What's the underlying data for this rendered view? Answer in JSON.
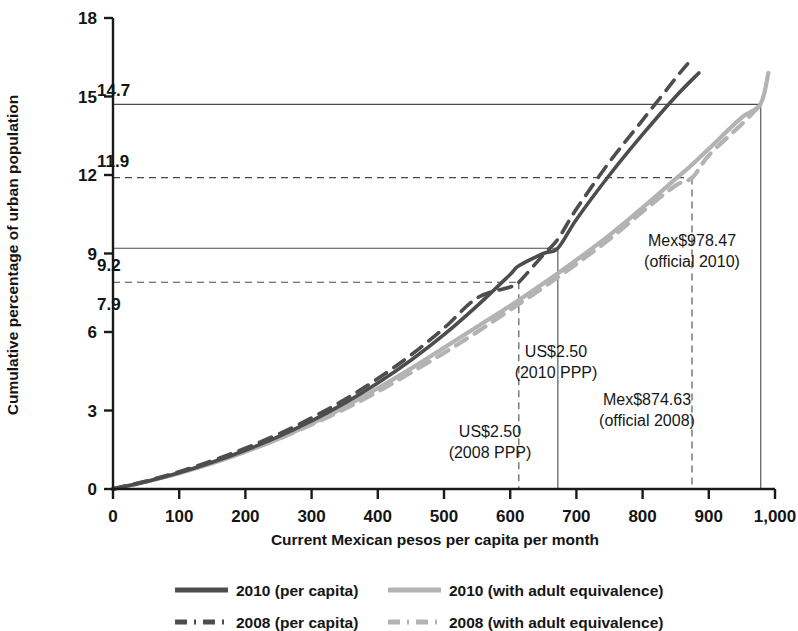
{
  "chart_data": {
    "type": "line",
    "title": "",
    "xlabel": "Current Mexican pesos per capita per month",
    "ylabel": "Cumulative percentage of urban population",
    "xlim": [
      0,
      1000
    ],
    "ylim": [
      0,
      18
    ],
    "xticks": [
      0,
      100,
      200,
      300,
      400,
      500,
      600,
      700,
      800,
      900,
      1000
    ],
    "xtick_labels": [
      "0",
      "100",
      "200",
      "300",
      "400",
      "500",
      "600",
      "700",
      "800",
      "900",
      "1,000"
    ],
    "yticks": [
      0,
      3,
      6,
      9,
      12,
      15,
      18
    ],
    "ytick_labels": [
      "0",
      "3",
      "6",
      "9",
      "12",
      "15",
      "18"
    ],
    "grid": false,
    "legend_position": "below",
    "series": [
      {
        "name": "2010 (per capita)",
        "style": "solid",
        "color": "#4d4d4d",
        "x": [
          0,
          50,
          100,
          150,
          200,
          250,
          300,
          350,
          400,
          450,
          500,
          550,
          600,
          613,
          650,
          672,
          700,
          750,
          800,
          850,
          885
        ],
        "y": [
          0,
          0.28,
          0.62,
          1.02,
          1.48,
          2.0,
          2.6,
          3.28,
          4.05,
          4.92,
          5.9,
          7.0,
          8.2,
          8.53,
          9.0,
          9.2,
          10.3,
          12.0,
          13.55,
          15.0,
          15.9
        ]
      },
      {
        "name": "2008 (per capita)",
        "style": "dashed",
        "color": "#4d4d4d",
        "x": [
          0,
          50,
          100,
          150,
          200,
          250,
          300,
          350,
          400,
          450,
          500,
          550,
          600,
          613,
          650,
          672,
          700,
          750,
          800,
          850,
          868
        ],
        "y": [
          0,
          0.3,
          0.66,
          1.08,
          1.56,
          2.1,
          2.72,
          3.42,
          4.22,
          5.12,
          6.15,
          7.3,
          7.72,
          7.9,
          8.95,
          9.55,
          10.7,
          12.5,
          14.1,
          15.7,
          16.25
        ]
      },
      {
        "name": "2010 (with adult equivalence)",
        "style": "solid",
        "color": "#b3b3b3",
        "x": [
          0,
          50,
          100,
          150,
          200,
          250,
          300,
          350,
          400,
          450,
          500,
          550,
          600,
          650,
          700,
          750,
          800,
          850,
          875,
          900,
          950,
          978,
          990
        ],
        "y": [
          0,
          0.28,
          0.6,
          0.98,
          1.42,
          1.92,
          2.5,
          3.14,
          3.85,
          4.6,
          5.4,
          6.2,
          7.0,
          7.85,
          8.75,
          9.7,
          10.75,
          11.85,
          12.4,
          13.0,
          14.2,
          14.7,
          15.9
        ]
      },
      {
        "name": "2008 (with adult equivalence)",
        "style": "dashed",
        "color": "#b3b3b3",
        "x": [
          0,
          50,
          100,
          150,
          200,
          250,
          300,
          350,
          400,
          450,
          500,
          550,
          600,
          650,
          700,
          750,
          800,
          850,
          875,
          900,
          950,
          975
        ],
        "y": [
          0,
          0.29,
          0.62,
          1.0,
          1.44,
          1.92,
          2.46,
          3.06,
          3.72,
          4.45,
          5.2,
          6.0,
          6.85,
          7.7,
          8.6,
          9.55,
          10.6,
          11.6,
          11.9,
          12.75,
          13.95,
          14.6
        ]
      }
    ],
    "reference_lines": [
      {
        "value_label": "14.7",
        "y": 14.7,
        "x": 978.47,
        "hline_style": "solid",
        "vline_style": "solid",
        "callout": [
          "Mex$978.47",
          "(official 2010)"
        ]
      },
      {
        "value_label": "11.9",
        "y": 11.9,
        "x": 874.63,
        "hline_style": "dashed",
        "vline_style": "dashed",
        "callout": [
          "Mex$874.63",
          "(official 2008)"
        ]
      },
      {
        "value_label": "9.2",
        "y": 9.2,
        "x": 672,
        "hline_style": "solid",
        "vline_style": "solid",
        "callout": [
          "US$2.50",
          "(2010 PPP)"
        ]
      },
      {
        "value_label": "7.9",
        "y": 7.9,
        "x": 613,
        "hline_style": "dashed",
        "vline_style": "dashed",
        "callout": [
          "US$2.50",
          "(2008 PPP)"
        ]
      }
    ],
    "legend": [
      {
        "label": "2010 (per capita)",
        "style": "solid",
        "color": "#4d4d4d"
      },
      {
        "label": "2010 (with adult equivalence)",
        "style": "solid",
        "color": "#b3b3b3"
      },
      {
        "label": "2008 (per capita)",
        "style": "dashed",
        "color": "#4d4d4d"
      },
      {
        "label": "2008 (with adult equivalence)",
        "style": "dashed",
        "color": "#b3b3b3"
      }
    ]
  },
  "axis": {
    "ylabel": "Cumulative percentage of urban population",
    "xlabel": "Current Mexican pesos per capita per month",
    "ytick_labels": [
      "18",
      "15",
      "12",
      "9",
      "6",
      "3",
      "0"
    ],
    "xtick_labels": [
      "0",
      "100",
      "200",
      "300",
      "400",
      "500",
      "600",
      "700",
      "800",
      "900",
      "1,000"
    ]
  },
  "annotations": {
    "v147": "14.7",
    "v119": "11.9",
    "v92": "9.2",
    "v79": "7.9",
    "mex978_l1": "Mex$978.47",
    "mex978_l2": "(official 2010)",
    "mex874_l1": "Mex$874.63",
    "mex874_l2": "(official 2008)",
    "ppp2010_l1": "US$2.50",
    "ppp2010_l2": "(2010 PPP)",
    "ppp2008_l1": "US$2.50",
    "ppp2008_l2": "(2008 PPP)"
  },
  "legend": {
    "item0": "2010 (per capita)",
    "item1": "2010 (with adult equivalence)",
    "item2": "2008 (per capita)",
    "item3": "2008 (with adult equivalence)"
  },
  "colors": {
    "dark_series": "#4d4d4d",
    "light_series": "#b3b3b3",
    "axis": "#1a1a1a",
    "reference": "#4a4a4a"
  }
}
